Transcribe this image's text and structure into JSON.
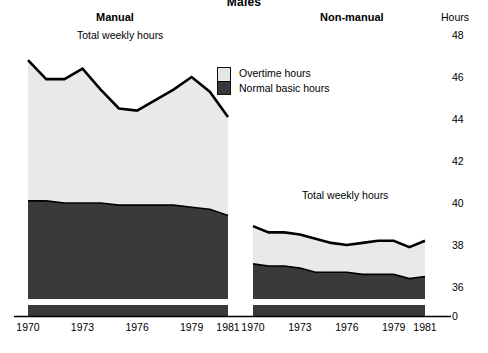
{
  "title": "Males",
  "axis": {
    "hours_label": "Hours",
    "y_ticks": [
      48,
      46,
      44,
      42,
      40,
      38,
      36,
      0
    ],
    "x_ticks": [
      1970,
      1973,
      1976,
      1979,
      1981
    ]
  },
  "legend": {
    "overtime_label": "Overtime hours",
    "basic_label": "Normal basic hours",
    "overtime_color": "#e6e6e6",
    "basic_color": "#3a3a3a"
  },
  "panels": {
    "manual": {
      "title": "Manual",
      "series_label": "Total weekly hours"
    },
    "nonmanual": {
      "title": "Non-manual",
      "series_label": "Total weekly hours"
    }
  },
  "chart_data": {
    "type": "area",
    "title": "Males",
    "subtitle": "Average weekly hours of work, manual and non-manual males",
    "xlabel": "",
    "ylabel": "Hours",
    "ylim": [
      35,
      48
    ],
    "axis_break": true,
    "axis_break_value": 0,
    "grid": false,
    "legend_position": "center",
    "panels": [
      {
        "name": "Manual",
        "series_label": "Total weekly hours",
        "x": [
          1970,
          1971,
          1972,
          1973,
          1974,
          1975,
          1976,
          1977,
          1978,
          1979,
          1980,
          1981
        ],
        "series": [
          {
            "name": "Normal basic hours",
            "values": [
              40.1,
              40.1,
              40.0,
              40.0,
              40.0,
              39.9,
              39.9,
              39.9,
              39.9,
              39.8,
              39.7,
              39.4
            ]
          },
          {
            "name": "Overtime hours",
            "values": [
              6.7,
              5.8,
              5.9,
              6.4,
              5.4,
              4.6,
              4.5,
              5.0,
              5.5,
              6.2,
              5.6,
              4.7
            ]
          }
        ],
        "total_weekly_hours": [
          46.8,
          45.9,
          45.9,
          46.4,
          45.4,
          44.5,
          44.4,
          44.9,
          45.4,
          46.0,
          45.3,
          44.1
        ]
      },
      {
        "name": "Non-manual",
        "series_label": "Total weekly hours",
        "x": [
          1970,
          1971,
          1972,
          1973,
          1974,
          1975,
          1976,
          1977,
          1978,
          1979,
          1980,
          1981
        ],
        "series": [
          {
            "name": "Normal basic hours",
            "values": [
              37.1,
              37.0,
              37.0,
              36.9,
              36.7,
              36.7,
              36.7,
              36.6,
              36.6,
              36.6,
              36.4,
              36.5
            ]
          },
          {
            "name": "Overtime hours",
            "values": [
              1.8,
              1.6,
              1.6,
              1.6,
              1.6,
              1.4,
              1.3,
              1.5,
              1.6,
              1.6,
              1.5,
              1.7
            ]
          }
        ],
        "total_weekly_hours": [
          38.9,
          38.6,
          38.6,
          38.5,
          38.3,
          38.1,
          38.0,
          38.1,
          38.2,
          38.2,
          37.9,
          38.2
        ]
      }
    ]
  }
}
